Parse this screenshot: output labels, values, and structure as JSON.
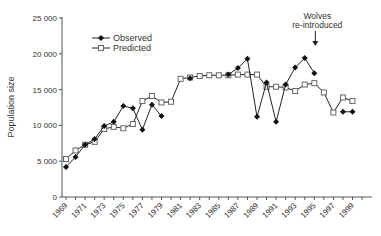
{
  "chart_data": {
    "type": "line",
    "title": "",
    "xlabel": "",
    "ylabel": "Population  size",
    "ylim": [
      0,
      25000
    ],
    "yticks": [
      0,
      5000,
      10000,
      15000,
      20000,
      25000
    ],
    "ytick_labels": [
      "0",
      "5 000",
      "10 000",
      "15 000",
      "20 000",
      "25 000"
    ],
    "xlim": [
      1969,
      2000
    ],
    "xtick_labels": [
      "1969",
      "1971",
      "1973",
      "1975",
      "1977",
      "1979",
      "1981",
      "1983",
      "1985",
      "1987",
      "1989",
      "1991",
      "1993",
      "1995",
      "1997",
      "1999"
    ],
    "legend": [
      "Observed",
      "Predicted"
    ],
    "legend_position": "upper left",
    "grid": false,
    "annotation": {
      "text": [
        "Wolves",
        "re-introduced"
      ],
      "x": 1995
    },
    "series": [
      {
        "name": "Observed",
        "marker": "filled-diamond",
        "segments": [
          [
            [
              1969,
              4200
            ],
            [
              1970,
              5600
            ],
            [
              1971,
              7300
            ],
            [
              1972,
              8100
            ],
            [
              1973,
              9900
            ],
            [
              1974,
              10500
            ],
            [
              1975,
              12700
            ],
            [
              1976,
              12400
            ],
            [
              1977,
              9400
            ],
            [
              1978,
              12900
            ],
            [
              1979,
              11300
            ]
          ],
          [
            [
              1982,
              16600
            ]
          ],
          [
            [
              1986,
              17100
            ],
            [
              1987,
              18000
            ],
            [
              1988,
              19300
            ],
            [
              1989,
              11200
            ],
            [
              1990,
              16000
            ],
            [
              1991,
              10500
            ],
            [
              1992,
              15700
            ],
            [
              1993,
              18100
            ],
            [
              1994,
              19400
            ],
            [
              1995,
              17300
            ]
          ],
          [
            [
              1998,
              11900
            ],
            [
              1999,
              11900
            ]
          ]
        ]
      },
      {
        "name": "Predicted",
        "marker": "open-square",
        "segments": [
          [
            [
              1969,
              5300
            ],
            [
              1970,
              6500
            ],
            [
              1971,
              7300
            ],
            [
              1972,
              7700
            ],
            [
              1973,
              9500
            ],
            [
              1974,
              9800
            ],
            [
              1975,
              9600
            ],
            [
              1976,
              10200
            ],
            [
              1977,
              13400
            ],
            [
              1978,
              14100
            ],
            [
              1979,
              13200
            ],
            [
              1980,
              13300
            ],
            [
              1981,
              16500
            ],
            [
              1982,
              16700
            ],
            [
              1983,
              16900
            ],
            [
              1984,
              17000
            ],
            [
              1985,
              17000
            ],
            [
              1986,
              17000
            ],
            [
              1987,
              17100
            ],
            [
              1988,
              17100
            ],
            [
              1989,
              17100
            ],
            [
              1990,
              15400
            ],
            [
              1991,
              15400
            ],
            [
              1992,
              15300
            ],
            [
              1993,
              14800
            ],
            [
              1994,
              15700
            ],
            [
              1995,
              15900
            ],
            [
              1996,
              14600
            ],
            [
              1997,
              11800
            ],
            [
              1998,
              13900
            ],
            [
              1999,
              13400
            ]
          ]
        ]
      }
    ]
  }
}
